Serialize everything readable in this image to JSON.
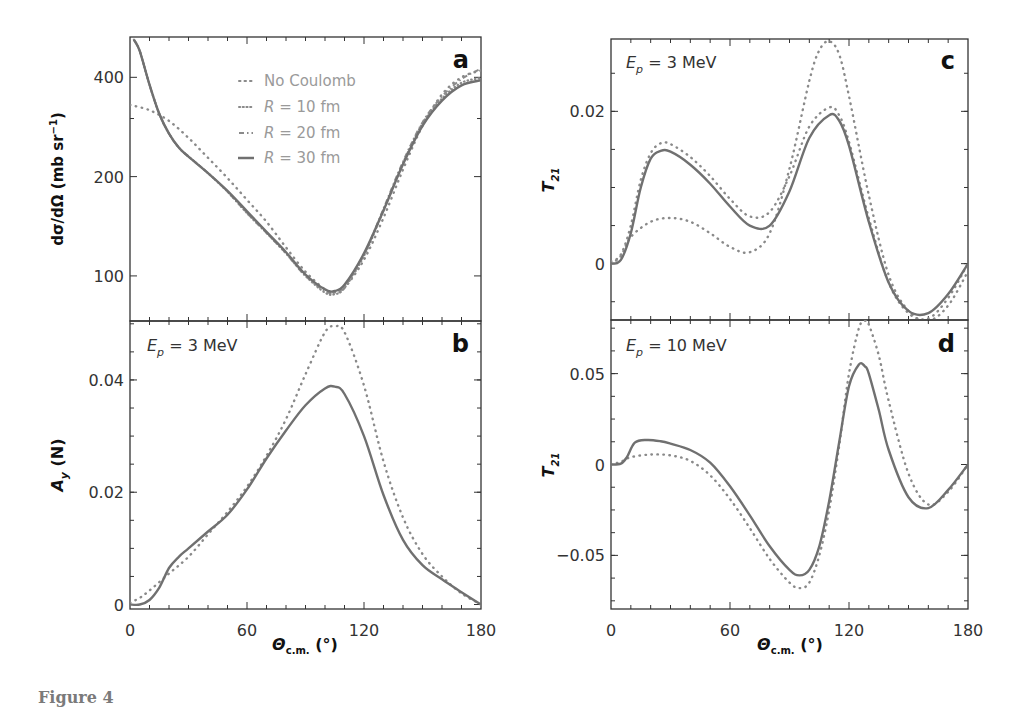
{
  "figure": {
    "caption": "Figure 4"
  },
  "colors": {
    "curve": "#707070",
    "dotted": "#8a8a8a",
    "axis": "#333333",
    "legend_text": "#9a9a9a",
    "panel_label": "#111111"
  },
  "chart_data": [
    {
      "id": "a",
      "type": "line",
      "panel_label": "a",
      "title": "",
      "xlabel": "",
      "ylabel": "dσ/dΩ (mb sr⁻¹)",
      "yscale": "log",
      "xlim": [
        0,
        180
      ],
      "ylim": [
        73,
        530
      ],
      "yticks": [
        100,
        200,
        400
      ],
      "ytick_labels": [
        "100",
        "200",
        "400"
      ],
      "xticks": [
        0,
        60,
        120,
        180
      ],
      "legend": [
        "No Coulomb",
        "R = 10 fm",
        "R = 20 fm",
        "R = 30 fm"
      ],
      "legend_position": "upper center",
      "series": [
        {
          "name": "No Coulomb",
          "style": "dotted",
          "x": [
            0,
            10,
            20,
            30,
            40,
            50,
            60,
            70,
            80,
            90,
            100,
            105,
            110,
            120,
            130,
            140,
            150,
            160,
            170,
            180
          ],
          "y": [
            330,
            318,
            295,
            262,
            228,
            198,
            170,
            146,
            122,
            103,
            91,
            89,
            92,
            112,
            150,
            210,
            285,
            355,
            400,
            420
          ]
        },
        {
          "name": "R = 10 fm",
          "style": "dotted-fine",
          "x": [
            2,
            5,
            10,
            15,
            20,
            25,
            30,
            40,
            50,
            60,
            70,
            80,
            90,
            100,
            105,
            110,
            120,
            130,
            140,
            150,
            160,
            170,
            180
          ],
          "y": [
            520,
            480,
            380,
            310,
            270,
            245,
            230,
            205,
            180,
            155,
            135,
            117,
            100,
            89,
            88,
            92,
            115,
            158,
            220,
            290,
            345,
            385,
            398
          ]
        },
        {
          "name": "R = 20 fm",
          "style": "dash-dot",
          "x": [
            2,
            5,
            10,
            15,
            20,
            25,
            30,
            40,
            50,
            60,
            70,
            80,
            90,
            100,
            105,
            110,
            120,
            130,
            140,
            150,
            160,
            170,
            180
          ],
          "y": [
            520,
            480,
            380,
            310,
            270,
            245,
            230,
            205,
            180,
            155,
            135,
            117,
            100,
            90,
            89,
            93,
            116,
            160,
            222,
            292,
            350,
            395,
            425
          ]
        },
        {
          "name": "R = 30 fm",
          "style": "solid",
          "x": [
            2,
            5,
            10,
            15,
            20,
            25,
            30,
            40,
            50,
            60,
            70,
            80,
            90,
            100,
            105,
            110,
            120,
            130,
            140,
            150,
            160,
            170,
            180
          ],
          "y": [
            520,
            480,
            380,
            310,
            270,
            245,
            230,
            205,
            181,
            157,
            136,
            118,
            101,
            91,
            90,
            94,
            117,
            158,
            218,
            285,
            340,
            378,
            392
          ]
        }
      ]
    },
    {
      "id": "b",
      "type": "line",
      "panel_label": "b",
      "annotation": "E_p = 3 MeV",
      "ylabel": "A_y (N)",
      "xlabel": "Θ_c.m. (°)",
      "xlim": [
        0,
        180
      ],
      "ylim": [
        -0.0008,
        0.0505
      ],
      "yticks": [
        0,
        0.02,
        0.04
      ],
      "ytick_labels": [
        "0",
        "0.02",
        "0.04"
      ],
      "xticks": [
        0,
        60,
        120,
        180
      ],
      "xtick_labels": [
        "0",
        "60",
        "120",
        "180"
      ],
      "series": [
        {
          "name": "No Coulomb",
          "style": "dotted",
          "x": [
            0,
            5,
            10,
            20,
            30,
            40,
            50,
            60,
            70,
            80,
            90,
            100,
            105,
            110,
            120,
            130,
            140,
            150,
            160,
            170,
            180
          ],
          "y": [
            0.0003,
            0.0012,
            0.0025,
            0.0055,
            0.0085,
            0.0125,
            0.0165,
            0.021,
            0.0265,
            0.033,
            0.041,
            0.0485,
            0.0495,
            0.0485,
            0.039,
            0.0255,
            0.0155,
            0.009,
            0.005,
            0.002,
            0.0
          ]
        },
        {
          "name": "R = 30 fm",
          "style": "solid",
          "x": [
            0,
            5,
            10,
            15,
            20,
            25,
            30,
            40,
            50,
            60,
            70,
            80,
            90,
            100,
            105,
            110,
            120,
            130,
            140,
            150,
            160,
            170,
            180
          ],
          "y": [
            0.0,
            0.0,
            0.0008,
            0.003,
            0.0065,
            0.0085,
            0.01,
            0.013,
            0.016,
            0.0205,
            0.026,
            0.031,
            0.0355,
            0.0385,
            0.0388,
            0.0375,
            0.03,
            0.0195,
            0.0115,
            0.007,
            0.0045,
            0.0022,
            0.0
          ]
        }
      ]
    },
    {
      "id": "c",
      "type": "line",
      "panel_label": "c",
      "annotation": "E_p = 3 MeV",
      "ylabel": "T_21",
      "xlim": [
        0,
        180
      ],
      "ylim": [
        -0.0074,
        0.0295
      ],
      "yticks": [
        0,
        0.02
      ],
      "ytick_labels": [
        "0",
        "0.02"
      ],
      "xticks": [
        0,
        60,
        120,
        180
      ],
      "series": [
        {
          "name": "No Coulomb",
          "style": "dotted",
          "x": [
            0,
            5,
            10,
            20,
            30,
            40,
            50,
            60,
            70,
            80,
            90,
            100,
            105,
            110,
            115,
            120,
            130,
            140,
            150,
            160,
            170,
            180
          ],
          "y": [
            0.0,
            0.001,
            0.0035,
            0.0055,
            0.006,
            0.0055,
            0.004,
            0.0022,
            0.0015,
            0.004,
            0.0125,
            0.024,
            0.028,
            0.0292,
            0.0275,
            0.022,
            0.009,
            -0.0015,
            -0.0062,
            -0.0075,
            -0.0055,
            -0.001
          ]
        },
        {
          "name": "R = 10 fm",
          "style": "dotted",
          "x": [
            0,
            5,
            10,
            15,
            20,
            25,
            30,
            40,
            50,
            60,
            70,
            80,
            90,
            100,
            110,
            115,
            120,
            130,
            140,
            150,
            160,
            170,
            180
          ],
          "y": [
            0.0003,
            0.0012,
            0.005,
            0.011,
            0.0145,
            0.0158,
            0.0157,
            0.014,
            0.0115,
            0.0085,
            0.0062,
            0.0068,
            0.0115,
            0.018,
            0.0205,
            0.0195,
            0.016,
            0.006,
            -0.0025,
            -0.0065,
            -0.0072,
            -0.0045,
            0.0
          ]
        },
        {
          "name": "R = 30 fm",
          "style": "solid",
          "x": [
            0,
            5,
            10,
            15,
            20,
            25,
            30,
            40,
            50,
            60,
            70,
            80,
            90,
            100,
            110,
            115,
            120,
            130,
            140,
            150,
            160,
            170,
            180
          ],
          "y": [
            0.0,
            0.0005,
            0.004,
            0.01,
            0.0138,
            0.0148,
            0.0147,
            0.013,
            0.0105,
            0.0075,
            0.005,
            0.005,
            0.0095,
            0.0165,
            0.0195,
            0.0188,
            0.0155,
            0.0055,
            -0.0025,
            -0.0062,
            -0.0065,
            -0.004,
            0.0
          ]
        }
      ]
    },
    {
      "id": "d",
      "type": "line",
      "panel_label": "d",
      "annotation": "E_p = 10 MeV",
      "ylabel": "T_21",
      "xlabel": "Θ_c.m. (°)",
      "xlim": [
        0,
        180
      ],
      "ylim": [
        -0.0795,
        0.0795
      ],
      "yticks": [
        -0.05,
        0,
        0.05
      ],
      "ytick_labels": [
        "−0.05",
        "0",
        "0.05"
      ],
      "xticks": [
        0,
        60,
        120,
        180
      ],
      "xtick_labels": [
        "0",
        "60",
        "120",
        "180"
      ],
      "series": [
        {
          "name": "No Coulomb",
          "style": "dotted",
          "x": [
            0,
            5,
            10,
            20,
            30,
            40,
            50,
            60,
            70,
            80,
            90,
            95,
            100,
            105,
            110,
            115,
            120,
            125,
            128,
            130,
            135,
            140,
            150,
            160,
            170,
            180
          ],
          "y": [
            0.0,
            0.0015,
            0.004,
            0.0055,
            0.005,
            0.002,
            -0.006,
            -0.019,
            -0.035,
            -0.052,
            -0.065,
            -0.068,
            -0.065,
            -0.05,
            -0.025,
            0.01,
            0.05,
            0.075,
            0.079,
            0.077,
            0.06,
            0.035,
            -0.005,
            -0.022,
            -0.015,
            0.0
          ]
        },
        {
          "name": "R = 30 fm",
          "style": "solid",
          "x": [
            0,
            5,
            8,
            12,
            18,
            25,
            30,
            40,
            50,
            60,
            70,
            80,
            90,
            95,
            100,
            105,
            110,
            115,
            120,
            125,
            128,
            130,
            135,
            140,
            150,
            160,
            170,
            180
          ],
          "y": [
            0.0,
            0.0005,
            0.004,
            0.012,
            0.0135,
            0.0128,
            0.0115,
            0.008,
            0.001,
            -0.012,
            -0.028,
            -0.045,
            -0.058,
            -0.061,
            -0.058,
            -0.045,
            -0.02,
            0.012,
            0.043,
            0.055,
            0.054,
            0.05,
            0.03,
            0.008,
            -0.018,
            -0.024,
            -0.014,
            0.0
          ]
        }
      ]
    }
  ],
  "labels": {
    "a_ylabel_main": "dσ/dΩ (mb sr",
    "a_ylabel_sup": "−1",
    "a_ylabel_close": ")",
    "b_ylabel_A": "A",
    "b_ylabel_sub": "y",
    "b_ylabel_rest": " (N)",
    "t21_T": "T",
    "t21_sub": "21",
    "xlabel_theta": "Θ",
    "xlabel_sub": "c.m.",
    "xlabel_unit": " (°)",
    "ep_E": "E",
    "ep_sub": "p",
    "ep_3": " = 3 MeV",
    "ep_10": " = 10 MeV",
    "legend_no_coulomb": "No Coulomb",
    "legend_R": "R",
    "legend_10": " = 10 fm",
    "legend_20": " = 20 fm",
    "legend_30": " = 30 fm"
  }
}
